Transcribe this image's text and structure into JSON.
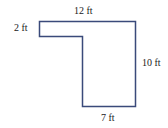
{
  "diagram": {
    "shape": "L-shaped floor plan outline",
    "stroke_color": "#3a4a7a",
    "labels": {
      "top": "12 ft",
      "left": "2 ft",
      "right": "10 ft",
      "bottom": "7 ft"
    }
  }
}
